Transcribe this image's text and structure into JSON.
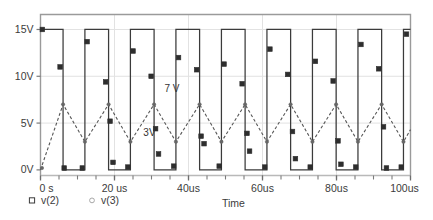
{
  "chart_data": {
    "type": "line",
    "title": "",
    "xlabel": "Time",
    "ylabel": "",
    "xlim": [
      0,
      100
    ],
    "ylim": [
      -0.6,
      16.6
    ],
    "grid": true,
    "x_unit": "us",
    "xtick_labels": [
      "0 s",
      "20 us",
      "40us",
      "60us",
      "80us",
      "100us"
    ],
    "xtick_values": [
      0,
      20,
      40,
      60,
      80,
      100
    ],
    "xtick_minor_step": 5,
    "ytick_labels": [
      "0V",
      "5V",
      "10V",
      "15V"
    ],
    "ytick_values": [
      0,
      5,
      10,
      15
    ],
    "legend_position": "below-left",
    "annotations": [
      {
        "text": "7 V",
        "x": 33.5,
        "y": 8.3
      },
      {
        "text": "3V",
        "x": 27.8,
        "y": 3.6
      }
    ],
    "series": [
      {
        "name": "v(2)",
        "label": "v(2)",
        "style": "solid",
        "marker": "square",
        "color": "#3b3b3b",
        "description": "square wave oscillating between 0 V and 15 V",
        "points": [
          [
            0.0,
            15
          ],
          [
            6.1,
            15
          ],
          [
            6.1,
            0
          ],
          [
            12.0,
            0
          ],
          [
            12.0,
            15
          ],
          [
            18.4,
            15
          ],
          [
            18.4,
            0
          ],
          [
            24.3,
            0
          ],
          [
            24.3,
            15
          ],
          [
            30.7,
            15
          ],
          [
            30.7,
            0
          ],
          [
            36.6,
            0
          ],
          [
            36.6,
            15
          ],
          [
            43.0,
            15
          ],
          [
            43.0,
            0
          ],
          [
            48.9,
            0
          ],
          [
            48.9,
            15
          ],
          [
            55.3,
            15
          ],
          [
            55.3,
            0
          ],
          [
            61.2,
            0
          ],
          [
            61.2,
            15
          ],
          [
            67.6,
            15
          ],
          [
            67.6,
            0
          ],
          [
            73.5,
            0
          ],
          [
            73.5,
            15
          ],
          [
            79.9,
            15
          ],
          [
            79.9,
            0
          ],
          [
            85.8,
            0
          ],
          [
            85.8,
            15
          ],
          [
            92.2,
            15
          ],
          [
            92.2,
            0
          ],
          [
            98.1,
            0
          ],
          [
            98.1,
            15
          ],
          [
            100.0,
            15
          ]
        ],
        "markers": [
          [
            0.5,
            15
          ],
          [
            5.3,
            11.0
          ],
          [
            6.4,
            0.2
          ],
          [
            11.3,
            0.2
          ],
          [
            12.6,
            13.7
          ],
          [
            17.6,
            9.4
          ],
          [
            18.8,
            5.2
          ],
          [
            19.6,
            0.8
          ],
          [
            23.6,
            0.3
          ],
          [
            25.0,
            12.7
          ],
          [
            29.9,
            10.0
          ],
          [
            31.1,
            4.4
          ],
          [
            31.9,
            1.7
          ],
          [
            36.0,
            0.4
          ],
          [
            37.3,
            12.0
          ],
          [
            42.2,
            10.7
          ],
          [
            43.4,
            3.6
          ],
          [
            44.2,
            2.8
          ],
          [
            48.3,
            0.4
          ],
          [
            49.6,
            11.3
          ],
          [
            54.5,
            9.2
          ],
          [
            55.8,
            3.9
          ],
          [
            56.5,
            2.0
          ],
          [
            60.6,
            0.3
          ],
          [
            62.0,
            12.9
          ],
          [
            66.8,
            10.2
          ],
          [
            68.1,
            4.1
          ],
          [
            68.9,
            1.2
          ],
          [
            72.9,
            0.3
          ],
          [
            74.3,
            11.6
          ],
          [
            79.1,
            9.5
          ],
          [
            80.4,
            3.1
          ],
          [
            81.2,
            0.6
          ],
          [
            85.2,
            0.3
          ],
          [
            86.6,
            13.4
          ],
          [
            91.4,
            10.8
          ],
          [
            92.7,
            4.6
          ],
          [
            93.5,
            0.2
          ],
          [
            97.5,
            0.3
          ],
          [
            98.9,
            14.5
          ]
        ]
      },
      {
        "name": "v(3)",
        "label": "v(3)",
        "style": "dashed",
        "marker": "circle",
        "color": "#555555",
        "description": "triangle wave ramping up to 7 V and down to 3 V",
        "points": [
          [
            0.0,
            0.0
          ],
          [
            6.1,
            7.0
          ],
          [
            12.0,
            3.0
          ],
          [
            18.4,
            7.0
          ],
          [
            24.3,
            3.0
          ],
          [
            30.7,
            7.0
          ],
          [
            36.6,
            3.0
          ],
          [
            43.0,
            7.0
          ],
          [
            48.9,
            3.0
          ],
          [
            55.3,
            7.0
          ],
          [
            61.2,
            3.0
          ],
          [
            67.6,
            7.0
          ],
          [
            73.5,
            3.0
          ],
          [
            79.9,
            7.0
          ],
          [
            85.8,
            3.0
          ],
          [
            92.2,
            7.0
          ],
          [
            98.1,
            3.0
          ],
          [
            100.0,
            4.3
          ]
        ],
        "markers": [
          [
            0.4,
            0.2
          ],
          [
            6.1,
            7.0
          ],
          [
            12.0,
            3.0
          ],
          [
            18.4,
            7.0
          ],
          [
            24.3,
            3.0
          ],
          [
            30.7,
            7.0
          ],
          [
            36.6,
            3.0
          ],
          [
            43.0,
            7.0
          ],
          [
            48.9,
            3.0
          ],
          [
            55.3,
            7.0
          ],
          [
            61.2,
            3.0
          ],
          [
            67.6,
            7.0
          ],
          [
            73.5,
            3.0
          ],
          [
            79.9,
            7.0
          ],
          [
            85.8,
            3.0
          ],
          [
            92.2,
            7.0
          ],
          [
            98.1,
            3.0
          ]
        ]
      }
    ]
  },
  "legend": {
    "items": [
      {
        "label": "v(2)",
        "marker": "square"
      },
      {
        "label": "v(3)",
        "marker": "circle"
      }
    ]
  },
  "axis": {
    "x_title": "Time"
  },
  "colors": {
    "frame": "#9a9a9a",
    "grid": "#e2e2e2",
    "trace_primary": "#3b3b3b",
    "trace_secondary": "#555555",
    "text": "#3b3b3b",
    "background": "#ffffff"
  }
}
